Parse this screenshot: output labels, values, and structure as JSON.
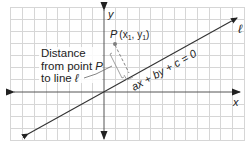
{
  "diagram": {
    "axes": {
      "x_label": "x",
      "y_label": "y"
    },
    "line": {
      "name_label": "ℓ",
      "equation": "ax + by + c = 0"
    },
    "point": {
      "label": "P",
      "coords": "(x",
      "sub1": "1",
      "comma": ", y",
      "sub2": "1",
      "close": ")"
    },
    "callout": {
      "line1": "Distance",
      "line2": "from point ",
      "line2_var": "P",
      "line3": "to line ",
      "line3_var": "ℓ"
    },
    "colors": {
      "grid": "#d4d4d4",
      "axis": "#333333",
      "line": "#333333",
      "point": "#808080",
      "text": "#222222"
    }
  }
}
